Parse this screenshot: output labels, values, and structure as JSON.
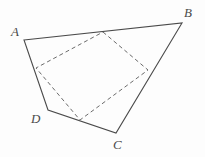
{
  "figure": {
    "type": "geometry-diagram",
    "background_color": "#fdfdfd",
    "stroke_color": "#4a4a4a",
    "dash_color": "#6b6b6b",
    "solid_stroke_width": 1.1,
    "dashed_stroke_width": 1.0,
    "dash_pattern": "4 3"
  },
  "labels": {
    "a": "A",
    "b": "B",
    "c": "C",
    "d": "D"
  },
  "outer_quadrilateral": {
    "name": "ABCD",
    "style": "solid",
    "vertices": [
      {
        "id": "A",
        "x": 24,
        "y": 40
      },
      {
        "id": "B",
        "x": 182,
        "y": 23
      },
      {
        "id": "C",
        "x": 116,
        "y": 133
      },
      {
        "id": "D",
        "x": 48,
        "y": 110
      }
    ],
    "edges": [
      {
        "from": "A",
        "to": "B"
      },
      {
        "from": "B",
        "to": "C"
      },
      {
        "from": "C",
        "to": "D"
      },
      {
        "from": "D",
        "to": "A"
      }
    ],
    "path": "M 24 40 L 182 23 L 116 133 L 48 110 Z"
  },
  "inner_quadrilateral": {
    "name": "PQRS",
    "style": "dashed",
    "vertices": [
      {
        "id": "P",
        "x": 103,
        "y": 32,
        "on_edge": "AB"
      },
      {
        "id": "Q",
        "x": 148,
        "y": 70,
        "on_edge": "BC"
      },
      {
        "id": "R",
        "x": 80,
        "y": 120,
        "on_edge": "CD"
      },
      {
        "id": "S",
        "x": 36,
        "y": 68,
        "on_edge": "DA"
      }
    ],
    "edges": [
      {
        "from": "P",
        "to": "Q"
      },
      {
        "from": "Q",
        "to": "R"
      },
      {
        "from": "R",
        "to": "S"
      },
      {
        "from": "S",
        "to": "P"
      }
    ],
    "path": "M 103 32 L 148 70 L 80 120 L 36 68 Z"
  }
}
